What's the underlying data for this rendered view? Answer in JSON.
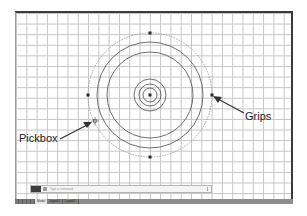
{
  "drawing": {
    "center": {
      "x": 150,
      "y": 95
    },
    "circles": [
      {
        "r": 62,
        "style": "dashed-selected"
      },
      {
        "r": 53,
        "style": "solid"
      },
      {
        "r": 43,
        "style": "solid"
      },
      {
        "r": 16,
        "style": "solid"
      },
      {
        "r": 11,
        "style": "solid"
      },
      {
        "r": 7,
        "style": "solid"
      }
    ],
    "grips": [
      {
        "name": "grip-center",
        "x": 150,
        "y": 95
      },
      {
        "name": "grip-top",
        "x": 150,
        "y": 33
      },
      {
        "name": "grip-bottom",
        "x": 150,
        "y": 157
      },
      {
        "name": "grip-left",
        "x": 88,
        "y": 95
      },
      {
        "name": "grip-right",
        "x": 212,
        "y": 95
      }
    ],
    "pickbox": {
      "x": 95,
      "y": 121
    }
  },
  "callouts": {
    "grips_label": "Grips",
    "pickbox_label": "Pickbox"
  },
  "command_line": {
    "placeholder": "Type a command"
  },
  "status_bar": {
    "tabs": [
      {
        "label": "Model",
        "active": true
      },
      {
        "label": "Layout1",
        "active": false
      },
      {
        "label": "Layout2",
        "active": false
      }
    ]
  },
  "colors": {
    "grip": "#2a2a2a",
    "circle": "#4a4a4a",
    "selected_circle": "#9a9a9a",
    "grid": "#c4c4c4"
  }
}
